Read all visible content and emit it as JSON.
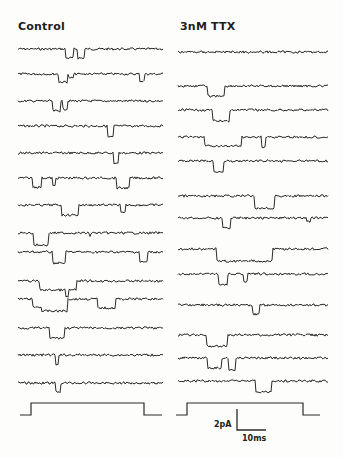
{
  "figure": {
    "panels": [
      {
        "id": "control",
        "title": "Control",
        "x_start": 18,
        "x_end": 163,
        "traces": [
          {
            "y": 49,
            "events": [
              [
                0.33,
                0.38,
                9
              ],
              [
                0.41,
                0.46,
                9
              ]
            ]
          },
          {
            "y": 74,
            "events": [
              [
                0.28,
                0.34,
                8
              ],
              [
                0.35,
                0.38,
                4
              ],
              [
                0.84,
                0.87,
                7
              ]
            ]
          },
          {
            "y": 101,
            "events": [
              [
                0.24,
                0.29,
                10
              ],
              [
                0.31,
                0.34,
                8
              ]
            ]
          },
          {
            "y": 126,
            "events": [
              [
                0.62,
                0.66,
                11
              ]
            ]
          },
          {
            "y": 153,
            "events": [
              [
                0.66,
                0.69,
                10
              ]
            ]
          },
          {
            "y": 178,
            "events": [
              [
                0.1,
                0.16,
                9
              ],
              [
                0.24,
                0.26,
                8
              ],
              [
                0.68,
                0.77,
                10
              ]
            ]
          },
          {
            "y": 205,
            "events": [
              [
                0.3,
                0.42,
                10
              ],
              [
                0.71,
                0.74,
                8
              ]
            ]
          },
          {
            "y": 233,
            "events": [
              [
                0.11,
                0.21,
                12
              ],
              [
                0.49,
                0.5,
                4
              ]
            ]
          },
          {
            "y": 252,
            "events": [
              [
                0.24,
                0.33,
                11
              ],
              [
                0.84,
                0.89,
                10
              ]
            ]
          },
          {
            "y": 281,
            "events": [
              [
                0.15,
                0.4,
                9
              ],
              [
                0.33,
                0.35,
                16
              ]
            ]
          },
          {
            "y": 299,
            "events": [
              [
                0.1,
                0.16,
                8
              ],
              [
                0.16,
                0.34,
                12
              ],
              [
                0.55,
                0.67,
                9
              ]
            ]
          },
          {
            "y": 328,
            "events": [
              [
                0.22,
                0.32,
                10
              ]
            ]
          },
          {
            "y": 355,
            "events": [
              [
                0.26,
                0.28,
                10
              ]
            ]
          },
          {
            "y": 383,
            "events": [
              [
                0.26,
                0.29,
                9
              ]
            ]
          }
        ]
      },
      {
        "id": "ttx",
        "title": "3nM TTX",
        "x_start": 178,
        "x_end": 328,
        "traces": [
          {
            "y": 52,
            "events": []
          },
          {
            "y": 86,
            "events": [
              [
                0.2,
                0.31,
                10
              ]
            ]
          },
          {
            "y": 110,
            "events": [
              [
                0.23,
                0.34,
                11
              ]
            ]
          },
          {
            "y": 137,
            "events": [
              [
                0.18,
                0.42,
                9
              ],
              [
                0.56,
                0.58,
                10
              ]
            ]
          },
          {
            "y": 161,
            "events": [
              [
                0.24,
                0.3,
                11
              ]
            ]
          },
          {
            "y": 196,
            "events": [
              [
                0.51,
                0.64,
                12
              ]
            ]
          },
          {
            "y": 218,
            "events": [
              [
                0.3,
                0.35,
                10
              ],
              [
                0.86,
                0.88,
                3
              ]
            ]
          },
          {
            "y": 249,
            "events": [
              [
                0.26,
                0.63,
                12
              ]
            ]
          },
          {
            "y": 274,
            "events": [
              [
                0.27,
                0.33,
                11
              ],
              [
                0.44,
                0.46,
                7
              ]
            ]
          },
          {
            "y": 305,
            "events": [
              [
                0.5,
                0.54,
                9
              ]
            ]
          },
          {
            "y": 335,
            "events": [
              [
                0.19,
                0.33,
                11
              ]
            ]
          },
          {
            "y": 358,
            "events": [
              [
                0.2,
                0.29,
                10
              ],
              [
                0.34,
                0.38,
                12
              ]
            ]
          },
          {
            "y": 381,
            "events": [
              [
                0.52,
                0.62,
                11
              ]
            ]
          }
        ]
      }
    ],
    "stimulus": [
      {
        "panel": "control",
        "x0": 20,
        "x_rise": 31,
        "x_fall": 144,
        "x1": 162,
        "y_low": 415,
        "y_high": 403
      },
      {
        "panel": "ttx",
        "x0": 176,
        "x_rise": 187,
        "x_fall": 303,
        "x1": 320,
        "y_low": 415,
        "y_high": 403
      }
    ],
    "scale_bar": {
      "current_label": "2pA",
      "time_label": "10ms",
      "x": 237,
      "y_top": 409,
      "y_bottom": 430,
      "x_right": 266
    },
    "colors": {
      "ink": "#2a2a2a",
      "background": "#fdfdfc"
    }
  }
}
